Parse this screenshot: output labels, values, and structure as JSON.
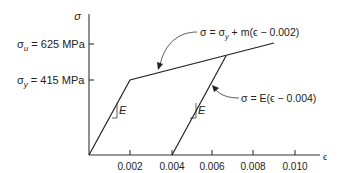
{
  "diagram": {
    "type": "stress-strain curve (elastic-linear hardening with unloading)",
    "y_axis": {
      "label": "σ"
    },
    "x_axis": {
      "label": "ϵ",
      "ticks": [
        "0.002",
        "0.004",
        "0.006",
        "0.008",
        "0.010"
      ]
    },
    "y_levels": [
      {
        "symbol": "σ",
        "sub": "u",
        "text": " = 625 MPa"
      },
      {
        "symbol": "σ",
        "sub": "y",
        "text": " = 415 MPa"
      }
    ],
    "slope_labels": [
      "E",
      "E"
    ],
    "annotations": {
      "hardening": {
        "lhs": "σ = σ",
        "sub": "y",
        "rhs": " + m(ϵ − 0.002)"
      },
      "unloading": {
        "text": "σ = E(ϵ − 0.004)"
      }
    }
  }
}
